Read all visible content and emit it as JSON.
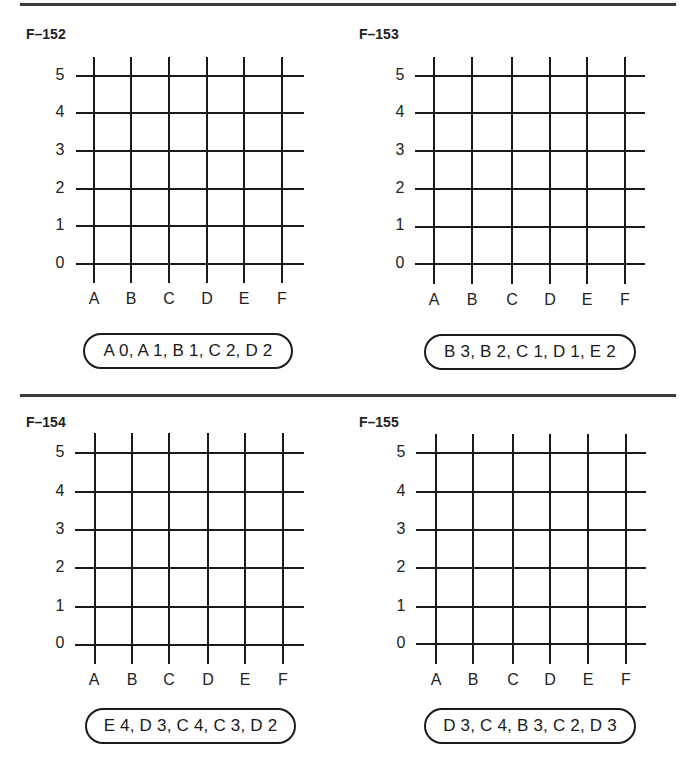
{
  "page": {
    "colors": {
      "ink": "#1a1a1a",
      "rule": "#3a3a3a",
      "background": "#ffffff"
    }
  },
  "axes": {
    "x_labels": [
      "A",
      "B",
      "C",
      "D",
      "E",
      "F"
    ],
    "y_labels": [
      "5",
      "4",
      "3",
      "2",
      "1",
      "0"
    ]
  },
  "panels": [
    {
      "id": "F-152",
      "title": "F–152",
      "coordinates": "A 0, A 1, B 1, C 2, D 2"
    },
    {
      "id": "F-153",
      "title": "F–153",
      "coordinates": "B 3, B 2, C 1, D 1, E 2"
    },
    {
      "id": "F-154",
      "title": "F–154",
      "coordinates": "E 4, D 3, C 4, C 3, D 2"
    },
    {
      "id": "F-155",
      "title": "F–155",
      "coordinates": "D 3, C 4, B 3, C 2, D 3"
    }
  ]
}
